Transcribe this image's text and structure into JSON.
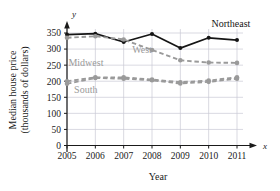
{
  "chart_data": {
    "type": "line",
    "title": "",
    "xlabel": "Year",
    "ylabel": "Median house price (thousands of dollars)",
    "x_axis_variable": "x",
    "y_axis_variable": "y",
    "grid": true,
    "legend_position": "inline-labels",
    "categories": [
      2005,
      2006,
      2007,
      2008,
      2009,
      2010,
      2011
    ],
    "x_tick_labels": [
      "2005",
      "2006",
      "2007",
      "2008",
      "2009",
      "2010",
      "2011"
    ],
    "y_tick_labels": [
      "0",
      "50",
      "100",
      "150",
      "200",
      "250",
      "300",
      "350"
    ],
    "y_ticks": [
      0,
      50,
      100,
      150,
      200,
      250,
      300,
      350
    ],
    "xlim": [
      2005,
      2011
    ],
    "ylim": [
      0,
      350
    ],
    "series": [
      {
        "name": "Northeast",
        "values": [
          345,
          348,
          322,
          347,
          303,
          335,
          328
        ],
        "color": "#151515",
        "style": "solid",
        "marker": "circle",
        "label_x": 2010.1,
        "label_y": 368
      },
      {
        "name": "West",
        "values": [
          335,
          340,
          330,
          297,
          265,
          258,
          257
        ],
        "color": "#9a9a9a",
        "style": "dashed",
        "marker": "circle",
        "label_x": 2007.3,
        "label_y": 288
      },
      {
        "name": "Midwest",
        "values": [
          200,
          212,
          212,
          205,
          197,
          202,
          212
        ],
        "color": "#9a9a9a",
        "style": "dashed",
        "marker": "circle",
        "label_x": 2005.05,
        "label_y": 248
      },
      {
        "name": "South",
        "values": [
          192,
          210,
          208,
          203,
          193,
          198,
          208
        ],
        "color": "#9a9a9a",
        "style": "dashed",
        "marker": "circle",
        "label_x": 2005.25,
        "label_y": 163
      }
    ],
    "colors": {
      "axis": "#1a1a1a",
      "grid": "#c9c9d4",
      "northeast": "#151515",
      "gray_series": "#9a9a9a",
      "background": "#ffffff"
    }
  }
}
